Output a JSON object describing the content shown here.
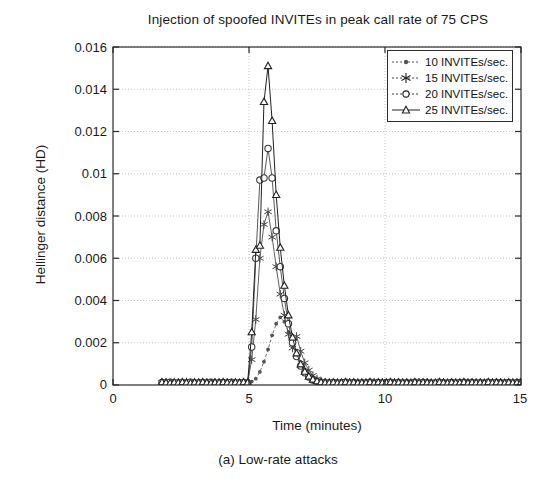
{
  "figure": {
    "title": "Injection of spoofed INVITEs in peak call rate of 75 CPS",
    "caption": "(a) Low-rate attacks"
  },
  "axes": {
    "xlabel": "Time (minutes)",
    "ylabel": "Hellinger distance (HD)",
    "xticks": [
      "0",
      "5",
      "10",
      "15"
    ],
    "yticks": [
      "0",
      "0.002",
      "0.004",
      "0.006",
      "0.008",
      "0.01",
      "0.012",
      "0.014",
      "0.016"
    ]
  },
  "legend": {
    "items": [
      {
        "label": "10 INVITEs/sec.",
        "marker": "dot-marker",
        "color": "#555555"
      },
      {
        "label": "15 INVITEs/sec.",
        "marker": "star-marker",
        "color": "#444444"
      },
      {
        "label": "20 INVITEs/sec.",
        "marker": "circle-marker",
        "color": "#3a3a3a"
      },
      {
        "label": "25 INVITEs/sec.",
        "marker": "triangle-marker",
        "color": "#222222"
      }
    ]
  },
  "chart_data": {
    "type": "line",
    "title": "Injection of spoofed INVITEs in peak call rate of 75 CPS",
    "xlabel": "Time (minutes)",
    "ylabel": "Hellinger distance (HD)",
    "xlim": [
      0,
      15
    ],
    "ylim": [
      0,
      0.016
    ],
    "xticks": [
      0,
      5,
      10,
      15
    ],
    "yticks": [
      0,
      0.002,
      0.004,
      0.006,
      0.008,
      0.01,
      0.012,
      0.014,
      0.016
    ],
    "grid": "dotted",
    "legend_position": "upper-right",
    "x": [
      1.8,
      1.95,
      2.1,
      2.25,
      2.4,
      2.55,
      2.7,
      2.85,
      3.0,
      3.15,
      3.3,
      3.45,
      3.6,
      3.75,
      3.9,
      4.05,
      4.2,
      4.35,
      4.5,
      4.65,
      4.8,
      4.95,
      5.1,
      5.25,
      5.4,
      5.55,
      5.7,
      5.85,
      6.0,
      6.15,
      6.3,
      6.45,
      6.6,
      6.75,
      6.9,
      7.05,
      7.2,
      7.35,
      7.5,
      7.65,
      7.8,
      7.95,
      8.1,
      8.25,
      8.4,
      8.55,
      8.7,
      8.85,
      9.0,
      9.15,
      9.3,
      9.45,
      9.6,
      9.75,
      9.9,
      10.05,
      10.2,
      10.35,
      10.5,
      10.65,
      10.8,
      10.95,
      11.1,
      11.25,
      11.4,
      11.55,
      11.7,
      11.85,
      12.0,
      12.15,
      12.3,
      12.45,
      12.6,
      12.75,
      12.9,
      13.05,
      13.2,
      13.35,
      13.5,
      13.65,
      13.8,
      13.95,
      14.1,
      14.25,
      14.4,
      14.55,
      14.7,
      14.85,
      15.0
    ],
    "series": [
      {
        "name": "10 INVITEs/sec.",
        "marker": "dot",
        "peak_value": 0.0032,
        "peak_time": 6.15,
        "values": [
          0.0001,
          0.00012,
          9e-05,
          0.00014,
          0.00011,
          8e-05,
          0.00013,
          0.0001,
          0.00012,
          9e-05,
          0.00011,
          0.00013,
          0.0001,
          8e-05,
          0.00012,
          0.00011,
          9e-05,
          0.00013,
          0.0001,
          0.00012,
          0.00011,
          9e-05,
          0.00016,
          0.0003,
          0.00062,
          0.0011,
          0.00168,
          0.00235,
          0.0029,
          0.0032,
          0.003,
          0.0025,
          0.0019,
          0.0014,
          0.00098,
          0.00068,
          0.00046,
          0.00032,
          0.00022,
          0.00016,
          0.00013,
          0.00011,
          0.0001,
          0.00012,
          9e-05,
          0.00011,
          0.00013,
          0.0001,
          0.00012,
          9e-05,
          0.00011,
          0.0001,
          0.00013,
          9e-05,
          0.00012,
          0.0001,
          0.00011,
          0.00013,
          9e-05,
          0.00012,
          0.0001,
          0.00011,
          9e-05,
          0.00013,
          0.0001,
          0.00012,
          0.00011,
          9e-05,
          0.0001,
          0.00013,
          0.00011,
          9e-05,
          0.00012,
          0.0001,
          0.00011,
          0.00013,
          9e-05,
          0.00012,
          0.0001,
          0.00011,
          9e-05,
          0.00013,
          0.0001,
          0.00012,
          0.00011,
          9e-05,
          0.00012,
          0.0001,
          0.00011
        ]
      },
      {
        "name": "15 INVITEs/sec.",
        "marker": "star",
        "peak_value": 0.0082,
        "peak_time": 5.7,
        "values": [
          0.00011,
          0.00013,
          0.0001,
          9e-05,
          0.00012,
          0.00011,
          0.00014,
          9e-05,
          0.00011,
          0.00013,
          0.0001,
          0.00012,
          9e-05,
          0.00011,
          0.00013,
          0.0001,
          0.00012,
          9e-05,
          0.00011,
          0.0001,
          0.00013,
          0.00011,
          0.0012,
          0.0031,
          0.006,
          0.0076,
          0.0082,
          0.007,
          0.0056,
          0.0043,
          0.0033,
          0.0024,
          0.00175,
          0.0023,
          0.0016,
          0.00105,
          0.0007,
          0.00045,
          0.00028,
          0.00018,
          0.00013,
          0.00011,
          0.0001,
          0.00012,
          9e-05,
          0.00011,
          0.00013,
          0.0001,
          0.00012,
          9e-05,
          0.00011,
          0.0001,
          0.00013,
          9e-05,
          0.00012,
          0.0001,
          0.00011,
          0.00013,
          9e-05,
          0.00012,
          0.0001,
          0.00011,
          9e-05,
          0.00013,
          0.0001,
          0.00012,
          0.00011,
          9e-05,
          0.0001,
          0.00013,
          0.00011,
          9e-05,
          0.00012,
          0.0001,
          0.00011,
          0.00013,
          9e-05,
          0.00012,
          0.0001,
          0.00011,
          9e-05,
          0.00013,
          0.0001,
          0.00012,
          0.00011,
          9e-05,
          0.00012,
          0.0001,
          0.00011
        ]
      },
      {
        "name": "20 INVITEs/sec.",
        "marker": "circle",
        "peak_value": 0.0112,
        "peak_time": 5.7,
        "values": [
          0.00012,
          0.0001,
          0.00013,
          9e-05,
          0.00011,
          0.00012,
          0.0001,
          0.00013,
          9e-05,
          0.00011,
          0.00012,
          0.0001,
          0.00013,
          9e-05,
          0.00011,
          0.00012,
          0.0001,
          0.00013,
          9e-05,
          0.00011,
          0.00012,
          0.0001,
          0.0018,
          0.006,
          0.0097,
          0.0098,
          0.0112,
          0.0098,
          0.0073,
          0.0056,
          0.0041,
          0.0029,
          0.002,
          0.00135,
          0.0009,
          0.00058,
          0.00038,
          0.00024,
          0.00017,
          0.00013,
          0.00011,
          0.0001,
          0.00012,
          9e-05,
          0.00011,
          0.00013,
          0.0001,
          0.00012,
          9e-05,
          0.00011,
          0.0001,
          0.00013,
          9e-05,
          0.00012,
          0.0001,
          0.00011,
          0.00013,
          9e-05,
          0.00012,
          0.0001,
          0.00011,
          9e-05,
          0.00013,
          0.0001,
          0.00012,
          0.00011,
          9e-05,
          0.0001,
          0.00013,
          0.00011,
          9e-05,
          0.00012,
          0.0001,
          0.00011,
          0.00013,
          9e-05,
          0.00012,
          0.0001,
          0.00011,
          9e-05,
          0.00013,
          0.0001,
          0.00012,
          0.00011,
          9e-05,
          0.00012,
          0.0001,
          0.00011,
          0.00013
        ]
      },
      {
        "name": "25 INVITEs/sec.",
        "marker": "triangle",
        "peak_value": 0.0151,
        "peak_time": 5.7,
        "values": [
          0.00013,
          0.00011,
          9e-05,
          0.00012,
          0.0001,
          0.00013,
          0.00011,
          9e-05,
          0.00012,
          0.0001,
          0.00013,
          0.00011,
          9e-05,
          0.00012,
          0.0001,
          0.00013,
          0.00011,
          9e-05,
          0.00012,
          0.0001,
          0.00013,
          0.00011,
          0.0025,
          0.0064,
          0.0066,
          0.0134,
          0.0151,
          0.0125,
          0.009,
          0.0065,
          0.0047,
          0.0033,
          0.00225,
          0.0015,
          0.00098,
          0.00063,
          0.0004,
          0.00026,
          0.00018,
          0.00013,
          0.00011,
          0.0001,
          0.00012,
          9e-05,
          0.00011,
          0.00013,
          0.0001,
          0.00012,
          9e-05,
          0.00011,
          0.0001,
          0.00013,
          9e-05,
          0.00012,
          0.0001,
          0.00011,
          0.00013,
          9e-05,
          0.00012,
          0.0001,
          0.00011,
          9e-05,
          0.00013,
          0.0001,
          0.00012,
          0.00011,
          9e-05,
          0.0001,
          0.00013,
          0.00011,
          9e-05,
          0.00012,
          0.0001,
          0.00011,
          0.00013,
          9e-05,
          0.00012,
          0.0001,
          0.00011,
          9e-05,
          0.00013,
          0.0001,
          0.00012,
          0.00011,
          9e-05,
          0.00012,
          0.0001,
          0.00011,
          0.00013
        ]
      }
    ]
  }
}
